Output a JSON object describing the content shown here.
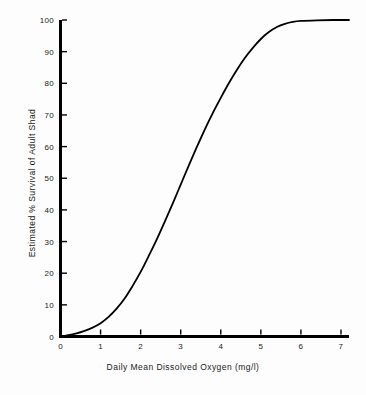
{
  "chart_data": {
    "type": "line",
    "title": "",
    "subtitle": "",
    "xlabel": "Daily Mean Dissolved Oxygen (mg/l)",
    "ylabel": "Estimated % Survival of Adult Shad",
    "xlim": [
      0,
      7.2
    ],
    "ylim": [
      0,
      100
    ],
    "xticks": [
      "0",
      "1",
      "2",
      "3",
      "4",
      "5",
      "6",
      "7"
    ],
    "xtick_values": [
      0,
      1,
      2,
      3,
      4,
      5,
      6,
      7
    ],
    "yticks": [
      "0",
      "10",
      "20",
      "30",
      "40",
      "50",
      "60",
      "70",
      "80",
      "90",
      "100"
    ],
    "ytick_values": [
      0,
      10,
      20,
      30,
      40,
      50,
      60,
      70,
      80,
      90,
      100
    ],
    "grid": false,
    "legend": null,
    "legend_position": "none",
    "line_color": "#000000",
    "line_width": 1.8,
    "axis_color": "#000000",
    "background_color": "#fdfdfd",
    "series": [
      {
        "name": "Estimated % survival",
        "x": [
          0.0,
          0.2,
          0.4,
          0.6,
          0.8,
          1.0,
          1.2,
          1.4,
          1.6,
          1.8,
          2.0,
          2.2,
          2.4,
          2.6,
          2.8,
          3.0,
          3.2,
          3.4,
          3.6,
          3.8,
          4.0,
          4.2,
          4.4,
          4.6,
          4.8,
          5.0,
          5.2,
          5.4,
          5.6,
          5.8,
          6.0,
          6.4,
          6.8,
          7.2
        ],
        "values": [
          0.0,
          0.4,
          1.0,
          1.8,
          2.8,
          4.2,
          6.2,
          8.8,
          12.0,
          16.0,
          20.4,
          25.4,
          30.6,
          36.2,
          42.0,
          48.0,
          54.0,
          59.8,
          65.4,
          70.6,
          75.4,
          80.0,
          84.2,
          88.0,
          91.2,
          94.0,
          96.2,
          97.8,
          98.8,
          99.4,
          99.7,
          99.9,
          100.0,
          100.0
        ]
      }
    ]
  },
  "figure": {
    "x_axis_title": "Daily Mean Dissolved Oxygen (mg/l)",
    "y_axis_title": "Estimated % Survival of Adult Shad"
  }
}
